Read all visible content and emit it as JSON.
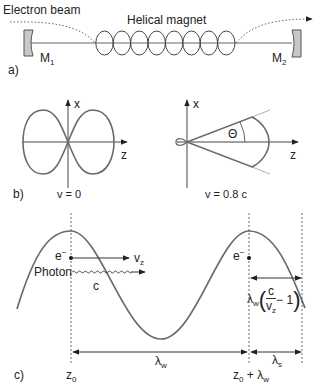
{
  "panel_a": {
    "label": "a)",
    "electron_beam_label": "Electron beam",
    "magnet_label": "Helical magnet",
    "mirror_left": {
      "symbol": "M",
      "subscript": "1"
    },
    "mirror_right": {
      "symbol": "M",
      "subscript": "2"
    },
    "helix_loops": 8
  },
  "panel_b": {
    "label": "b)",
    "left": {
      "axis_x": "x",
      "axis_z": "z",
      "caption": "v = 0"
    },
    "right": {
      "axis_x": "x",
      "axis_z": "z",
      "angle_label": "Θ",
      "caption": "v = 0.8 c"
    }
  },
  "panel_c": {
    "label": "c)",
    "electron_label": "e",
    "electron_sup": "−",
    "velocity_label": "v",
    "velocity_sub": "z",
    "photon_label": "Photon",
    "photon_speed": "c",
    "delay_prefix": "λ",
    "delay_prefix_sub": "w",
    "delay_num": "c",
    "delay_den": "v",
    "delay_den_sub": "z",
    "delay_suffix": "− 1",
    "lambda_w": "λ",
    "lambda_w_sub": "w",
    "lambda_s": "λ",
    "lambda_s_sub": "s",
    "z0": "z",
    "z0_sub": "0",
    "z0_plus": "+ λ",
    "z0_plus_sub": "w"
  },
  "colors": {
    "line": "#555555",
    "curve": "#6a6a6a",
    "mirror_fill": "#c8c8c8",
    "text": "#222222"
  }
}
